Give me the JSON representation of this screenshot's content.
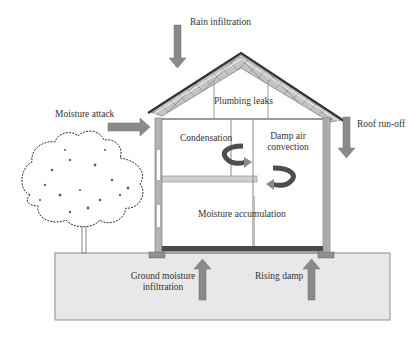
{
  "diagram": {
    "type": "house-moisture-sources",
    "colors": {
      "arrow": "#8a8a8a",
      "wall": "#a9a9a9",
      "ground": "#e8e8e8",
      "ground_border": "#8c8c8c",
      "roof_truss": "#bdbdbd",
      "roof_edge": "#3a3a3a",
      "floor_slab": "#4a4a4a"
    },
    "labels": {
      "rain_infiltration": "Rain infiltration",
      "plumbing_leaks": "Plumbing leaks",
      "moisture_attack": "Moisture attack",
      "roof_runoff": "Roof run-off",
      "condensation": "Condensation",
      "damp_air_convection_1": "Damp air",
      "damp_air_convection_2": "convection",
      "moisture_accumulation": "Moisture accumulation",
      "ground_moisture_1": "Ground moisture",
      "ground_moisture_2": "infiltration",
      "rising_damp": "Rising damp"
    }
  }
}
